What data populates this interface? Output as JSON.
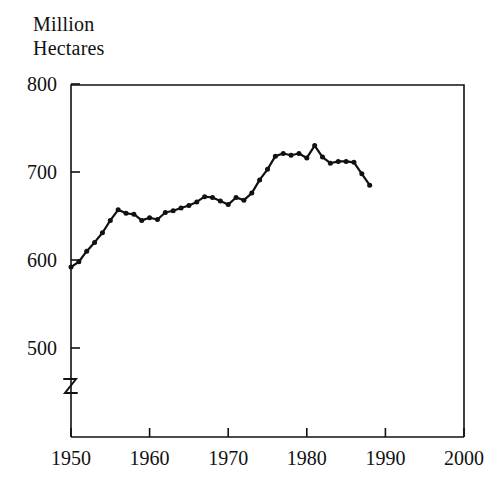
{
  "axis_title": "Million\nHectares",
  "chart_data": {
    "type": "line",
    "title": "",
    "subtitle": "",
    "ylabel": "Million Hectares",
    "xlabel": "",
    "xlim": [
      1950,
      2000
    ],
    "ylim": [
      445,
      800
    ],
    "y_axis_break": true,
    "y_break_below": 500,
    "grid": false,
    "legend": null,
    "marker": "filled-circle",
    "line_color": "#111111",
    "xticks": [
      1950,
      1960,
      1970,
      1980,
      1990,
      2000
    ],
    "xticklabels": [
      "1950",
      "1960",
      "1970",
      "1980",
      "1990",
      "2000"
    ],
    "yticks": [
      500,
      600,
      700,
      800
    ],
    "yticklabels": [
      "500",
      "600",
      "700",
      "800"
    ],
    "x": [
      1950,
      1951,
      1952,
      1953,
      1954,
      1955,
      1956,
      1957,
      1958,
      1959,
      1960,
      1961,
      1962,
      1963,
      1964,
      1965,
      1966,
      1967,
      1968,
      1969,
      1970,
      1971,
      1972,
      1973,
      1974,
      1975,
      1976,
      1977,
      1978,
      1979,
      1980,
      1981,
      1982,
      1983,
      1984,
      1985,
      1986,
      1987,
      1988
    ],
    "values": [
      592,
      598,
      610,
      620,
      631,
      645,
      657,
      653,
      652,
      645,
      648,
      646,
      654,
      656,
      659,
      662,
      666,
      672,
      671,
      667,
      663,
      671,
      668,
      676,
      691,
      703,
      718,
      721,
      719,
      721,
      716,
      730,
      717,
      710,
      712,
      712,
      711,
      698,
      685
    ],
    "series": [
      {
        "name": "World grain harvested area",
        "values": [
          592,
          598,
          610,
          620,
          631,
          645,
          657,
          653,
          652,
          645,
          648,
          646,
          654,
          656,
          659,
          662,
          666,
          672,
          671,
          667,
          663,
          671,
          668,
          676,
          691,
          703,
          718,
          721,
          719,
          721,
          716,
          730,
          717,
          710,
          712,
          712,
          711,
          698,
          685
        ]
      }
    ]
  }
}
